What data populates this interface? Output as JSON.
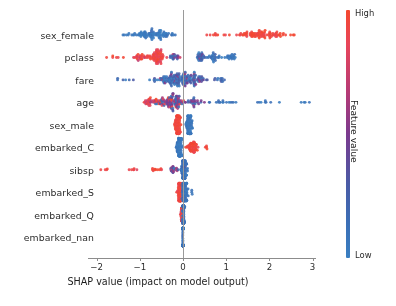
{
  "chart_data": {
    "type": "scatter",
    "plot_kind": "shap-beeswarm-summary",
    "title": "",
    "xlabel": "SHAP value (impact on model output)",
    "ylabel": "",
    "xlim": [
      -2.45,
      3.35
    ],
    "ylim": [
      -0.6,
      9.6
    ],
    "grid": false,
    "xticks": [
      -2,
      -1,
      0,
      1,
      2,
      3
    ],
    "xticklabels": [
      "−2",
      "−1",
      "0",
      "1",
      "2",
      "3"
    ],
    "categories": [
      "sex_female",
      "pclass",
      "fare",
      "age",
      "sex_male",
      "embarked_C",
      "sibsp",
      "embarked_S",
      "embarked_Q",
      "embarked_nan"
    ],
    "colorbar": {
      "label": "Feature value",
      "high_label": "High",
      "low_label": "Low",
      "high_color": "#f4482f",
      "low_color": "#3a7fc1",
      "mid_color": "#7b3a8e",
      "orientation": "vertical",
      "position": "right"
    },
    "zero_reference_line": 0,
    "series": [
      {
        "name": "sex_female",
        "row": 0,
        "n_points": 178,
        "shap_range": [
          -1.62,
          2.62
        ],
        "clusters": [
          {
            "center": -0.78,
            "spread": 0.42,
            "n": 86,
            "color_mean": 0.06,
            "color_spread": 0.05,
            "density": 1.0
          },
          {
            "center": 1.85,
            "spread": 0.58,
            "n": 84,
            "color_mean": 0.95,
            "color_spread": 0.05,
            "density": 0.95
          },
          {
            "center": 0.72,
            "spread": 0.18,
            "n": 8,
            "color_mean": 0.95,
            "color_spread": 0.04,
            "density": 0.18
          }
        ]
      },
      {
        "name": "pclass",
        "row": 1,
        "n_points": 170,
        "shap_range": [
          -1.92,
          1.28
        ],
        "clusters": [
          {
            "center": -0.58,
            "spread": 0.12,
            "n": 54,
            "color_mean": 0.93,
            "color_spread": 0.06,
            "density": 1.0
          },
          {
            "center": -0.95,
            "spread": 0.18,
            "n": 30,
            "color_mean": 0.9,
            "color_spread": 0.07,
            "density": 0.5
          },
          {
            "center": -1.55,
            "spread": 0.25,
            "n": 6,
            "color_mean": 0.9,
            "color_spread": 0.05,
            "density": 0.12
          },
          {
            "center": -0.2,
            "spread": 0.1,
            "n": 18,
            "color_mean": 0.45,
            "color_spread": 0.22,
            "density": 0.4
          },
          {
            "center": 0.42,
            "spread": 0.12,
            "n": 26,
            "color_mean": 0.22,
            "color_spread": 0.14,
            "density": 0.55
          },
          {
            "center": 0.72,
            "spread": 0.1,
            "n": 22,
            "color_mean": 0.1,
            "color_spread": 0.08,
            "density": 0.5
          },
          {
            "center": 1.1,
            "spread": 0.11,
            "n": 20,
            "color_mean": 0.07,
            "color_spread": 0.06,
            "density": 0.45
          }
        ]
      },
      {
        "name": "fare",
        "row": 2,
        "n_points": 176,
        "shap_range": [
          -1.8,
          1.12
        ],
        "clusters": [
          {
            "center": -0.18,
            "spread": 0.38,
            "n": 120,
            "color_mean": 0.2,
            "color_spread": 0.18,
            "density": 1.0
          },
          {
            "center": 0.35,
            "spread": 0.25,
            "n": 40,
            "color_mean": 0.35,
            "color_spread": 0.2,
            "density": 0.5
          },
          {
            "center": -1.35,
            "spread": 0.28,
            "n": 6,
            "color_mean": 0.25,
            "color_spread": 0.15,
            "density": 0.1
          },
          {
            "center": 0.85,
            "spread": 0.12,
            "n": 10,
            "color_mean": 0.18,
            "color_spread": 0.12,
            "density": 0.16
          }
        ]
      },
      {
        "name": "age",
        "row": 3,
        "n_points": 180,
        "shap_range": [
          -1.85,
          3.05
        ],
        "clusters": [
          {
            "center": -0.25,
            "spread": 0.25,
            "n": 92,
            "color_mean": 0.45,
            "color_spread": 0.28,
            "density": 1.0
          },
          {
            "center": -0.72,
            "spread": 0.2,
            "n": 34,
            "color_mean": 0.85,
            "color_spread": 0.12,
            "density": 0.5
          },
          {
            "center": 0.25,
            "spread": 0.22,
            "n": 26,
            "color_mean": 0.35,
            "color_spread": 0.2,
            "density": 0.42
          },
          {
            "center": 0.95,
            "spread": 0.3,
            "n": 16,
            "color_mean": 0.1,
            "color_spread": 0.08,
            "density": 0.18
          },
          {
            "center": 1.95,
            "spread": 0.45,
            "n": 8,
            "color_mean": 0.08,
            "color_spread": 0.05,
            "density": 0.1
          },
          {
            "center": 2.8,
            "spread": 0.25,
            "n": 4,
            "color_mean": 0.07,
            "color_spread": 0.04,
            "density": 0.08
          }
        ]
      },
      {
        "name": "sex_male",
        "row": 4,
        "n_points": 172,
        "shap_range": [
          -0.3,
          0.32
        ],
        "clusters": [
          {
            "center": -0.12,
            "spread": 0.05,
            "n": 86,
            "color_mean": 0.95,
            "color_spread": 0.03,
            "density": 1.0
          },
          {
            "center": 0.14,
            "spread": 0.06,
            "n": 84,
            "color_mean": 0.07,
            "color_spread": 0.03,
            "density": 0.95
          }
        ]
      },
      {
        "name": "embarked_C",
        "row": 5,
        "n_points": 174,
        "shap_range": [
          -0.22,
          0.62
        ],
        "clusters": [
          {
            "center": -0.08,
            "spread": 0.05,
            "n": 110,
            "color_mean": 0.06,
            "color_spread": 0.03,
            "density": 1.0
          },
          {
            "center": 0.22,
            "spread": 0.12,
            "n": 56,
            "color_mean": 0.95,
            "color_spread": 0.04,
            "density": 0.55
          },
          {
            "center": 0.55,
            "spread": 0.04,
            "n": 4,
            "color_mean": 0.95,
            "color_spread": 0.03,
            "density": 0.12
          }
        ]
      },
      {
        "name": "sibsp",
        "row": 6,
        "n_points": 168,
        "shap_range": [
          -1.92,
          0.18
        ],
        "clusters": [
          {
            "center": 0.02,
            "spread": 0.05,
            "n": 120,
            "color_mean": 0.12,
            "color_spread": 0.08,
            "density": 1.0
          },
          {
            "center": -0.22,
            "spread": 0.1,
            "n": 22,
            "color_mean": 0.55,
            "color_spread": 0.3,
            "density": 0.35
          },
          {
            "center": -0.62,
            "spread": 0.12,
            "n": 10,
            "color_mean": 0.92,
            "color_spread": 0.05,
            "density": 0.15
          },
          {
            "center": -1.15,
            "spread": 0.12,
            "n": 6,
            "color_mean": 0.92,
            "color_spread": 0.04,
            "density": 0.1
          },
          {
            "center": -1.78,
            "spread": 0.08,
            "n": 4,
            "color_mean": 0.92,
            "color_spread": 0.03,
            "density": 0.08
          }
        ]
      },
      {
        "name": "embarked_S",
        "row": 7,
        "n_points": 170,
        "shap_range": [
          -0.2,
          0.22
        ],
        "clusters": [
          {
            "center": -0.08,
            "spread": 0.05,
            "n": 70,
            "color_mean": 0.93,
            "color_spread": 0.05,
            "density": 1.0
          },
          {
            "center": 0.04,
            "spread": 0.05,
            "n": 92,
            "color_mean": 0.1,
            "color_spread": 0.06,
            "density": 0.85
          },
          {
            "center": 0.2,
            "spread": 0.02,
            "n": 3,
            "color_mean": 0.1,
            "color_spread": 0.03,
            "density": 0.1
          }
        ]
      },
      {
        "name": "embarked_Q",
        "row": 8,
        "n_points": 166,
        "shap_range": [
          -0.08,
          0.05
        ],
        "clusters": [
          {
            "center": -0.03,
            "spread": 0.02,
            "n": 40,
            "color_mean": 0.9,
            "color_spread": 0.06,
            "density": 0.6
          },
          {
            "center": 0.01,
            "spread": 0.02,
            "n": 120,
            "color_mean": 0.12,
            "color_spread": 0.07,
            "density": 1.0
          }
        ]
      },
      {
        "name": "embarked_nan",
        "row": 9,
        "n_points": 160,
        "shap_range": [
          -0.01,
          0.01
        ],
        "clusters": [
          {
            "center": 0.0,
            "spread": 0.004,
            "n": 160,
            "color_mean": 0.12,
            "color_spread": 0.05,
            "density": 1.0
          }
        ]
      }
    ]
  },
  "axes": {
    "x_title": "SHAP value (impact on model output)",
    "tick_labels": [
      "−2",
      "−1",
      "0",
      "1",
      "2",
      "3"
    ]
  },
  "colorbar": {
    "title": "Feature value",
    "high": "High",
    "low": "Low"
  }
}
